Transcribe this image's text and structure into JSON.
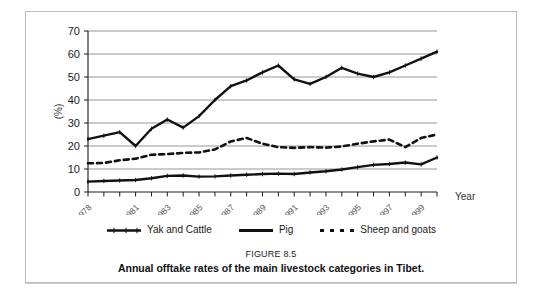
{
  "figure": {
    "number_label": "FIGURE 8.5",
    "caption": "Annual offtake rates of the main livestock categories in Tibet."
  },
  "legend": {
    "position": "below-plot",
    "items": [
      {
        "label": "Yak and Cattle",
        "style": "solid-thick-with-ticks",
        "color": "#111111"
      },
      {
        "label": "Pig",
        "style": "solid-thick",
        "color": "#111111"
      },
      {
        "label": "Sheep and goats",
        "style": "dashed-thick",
        "color": "#111111"
      }
    ]
  },
  "axes": {
    "x_title": "Year",
    "y_title": "(%)",
    "y_ticks": [
      "0",
      "10",
      "20",
      "30",
      "40",
      "50",
      "60",
      "70"
    ],
    "x_tick_labels": [
      "1978",
      "1981",
      "1983",
      "1985",
      "1987",
      "1989",
      "1991",
      "1993",
      "1995",
      "1997",
      "1999"
    ]
  },
  "chart_data": {
    "type": "line",
    "title": "Annual offtake rates of the main livestock categories in Tibet.",
    "xlabel": "Year",
    "ylabel": "(%)",
    "ylim": [
      0,
      70
    ],
    "xlim": [
      1978,
      2000
    ],
    "grid": "horizontal",
    "legend_position": "below",
    "x": [
      1978,
      1979,
      1980,
      1981,
      1982,
      1983,
      1984,
      1985,
      1986,
      1987,
      1988,
      1989,
      1990,
      1991,
      1992,
      1993,
      1994,
      1995,
      1996,
      1997,
      1998,
      1999,
      2000
    ],
    "series": [
      {
        "name": "Yak and Cattle",
        "color": "#111111",
        "values": [
          23.0,
          24.5,
          26.0,
          20.0,
          27.5,
          31.5,
          28.0,
          33.0,
          40.0,
          46.0,
          48.5,
          52.0,
          55.0,
          49.0,
          47.0,
          50.0,
          54.0,
          51.5,
          50.0,
          52.0,
          55.0,
          58.0,
          61.0
        ]
      },
      {
        "name": "Pig",
        "color": "#111111",
        "values": [
          4.5,
          4.8,
          5.0,
          5.2,
          6.0,
          7.0,
          7.2,
          6.7,
          6.8,
          7.2,
          7.5,
          7.8,
          8.0,
          7.8,
          8.5,
          9.0,
          9.8,
          10.8,
          11.8,
          12.2,
          12.8,
          12.0,
          15.0
        ]
      },
      {
        "name": "Sheep and goats",
        "color": "#111111",
        "values": [
          12.5,
          12.6,
          13.8,
          14.5,
          16.2,
          16.5,
          17.0,
          17.2,
          18.5,
          22.0,
          23.5,
          21.0,
          19.5,
          19.2,
          19.5,
          19.3,
          19.8,
          21.0,
          22.0,
          22.8,
          19.5,
          23.5,
          25.0
        ]
      }
    ]
  }
}
